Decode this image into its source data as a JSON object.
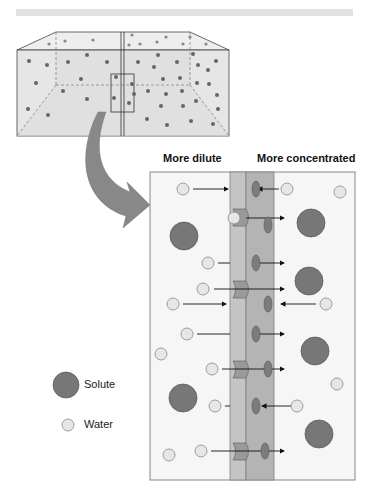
{
  "diagram": {
    "title_bar": "",
    "labels": {
      "left_side": "More dilute",
      "right_side": "More concentrated"
    },
    "legend": [
      {
        "symbol": "large-dark-circle",
        "label": "Solute"
      },
      {
        "symbol": "small-light-circle",
        "label": "Water"
      }
    ],
    "colors": {
      "solute": "#7a7a7a",
      "water": "#e4e4e4",
      "membrane_left": "#c4c4c4",
      "membrane_right": "#b0b0b0",
      "channel": "#9a9a9a",
      "arrow": "#8c8c8c"
    }
  }
}
